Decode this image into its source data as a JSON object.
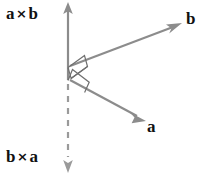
{
  "figure": {
    "background_color": "#ffffff",
    "vector_color": "#8c8c8c",
    "label_color": "#111111",
    "labels": {
      "up_axis": {
        "left": "a",
        "op": "×",
        "right": "b"
      },
      "down_axis": {
        "left": "b",
        "op": "×",
        "right": "a"
      },
      "vector_b": "b",
      "vector_a": "a"
    },
    "vectors": [
      {
        "name": "a-cross-b",
        "label": "a × b",
        "style": "solid",
        "from": [
          68,
          80
        ],
        "to": [
          68,
          4
        ],
        "arrowhead": "up"
      },
      {
        "name": "b-cross-a",
        "label": "b × a",
        "style": "dashed",
        "from": [
          68,
          80
        ],
        "to": [
          68,
          170
        ],
        "arrowhead": "down"
      },
      {
        "name": "vector-b",
        "label": "b",
        "style": "solid",
        "from": [
          70,
          66
        ],
        "to": [
          181,
          24
        ],
        "arrowhead": "end"
      },
      {
        "name": "vector-a",
        "label": "a",
        "style": "solid",
        "from": [
          70,
          80
        ],
        "to": [
          145,
          121
        ],
        "arrowhead": "end"
      }
    ],
    "right_angle_markers": [
      {
        "name": "right-angle-upper",
        "between": [
          "a-cross-b",
          "vector-b"
        ]
      },
      {
        "name": "right-angle-lower",
        "between": [
          "a-cross-b",
          "vector-a"
        ]
      }
    ]
  }
}
